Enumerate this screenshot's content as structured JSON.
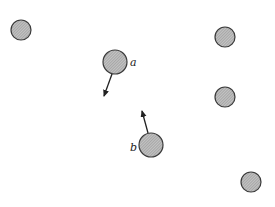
{
  "diagram": {
    "colors": {
      "fill": "#a8a8a8",
      "stroke": "#3a3a3a",
      "arrow": "#222222",
      "background": "#ffffff"
    },
    "particles": [
      {
        "id": "p1",
        "cx": 21,
        "cy": 30,
        "r": 10,
        "label": ""
      },
      {
        "id": "a",
        "cx": 115,
        "cy": 62,
        "r": 12,
        "label": "a"
      },
      {
        "id": "p3",
        "cx": 225,
        "cy": 37,
        "r": 10,
        "label": ""
      },
      {
        "id": "p4",
        "cx": 225,
        "cy": 97,
        "r": 10,
        "label": ""
      },
      {
        "id": "b",
        "cx": 151,
        "cy": 145,
        "r": 12,
        "label": "b"
      },
      {
        "id": "p6",
        "cx": 251,
        "cy": 182,
        "r": 10,
        "label": ""
      }
    ],
    "labels": {
      "a": "a",
      "b": "b"
    },
    "arrows": [
      {
        "from": "a",
        "x1": 112,
        "y1": 74,
        "x2": 104,
        "y2": 96,
        "direction": "down-left"
      },
      {
        "from": "b",
        "x1": 148,
        "y1": 133,
        "x2": 142,
        "y2": 111,
        "direction": "up-left"
      }
    ]
  }
}
